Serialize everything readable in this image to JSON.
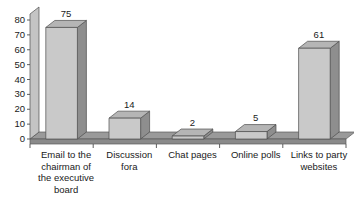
{
  "chart_data": {
    "type": "bar",
    "title": "",
    "subtitle": "",
    "xlabel": "",
    "ylabel": "",
    "ylim": [
      0,
      80
    ],
    "ytick_step": 10,
    "yticks": [
      "0",
      "10",
      "20",
      "30",
      "40",
      "50",
      "60",
      "70",
      "80"
    ],
    "grid": false,
    "legend": false,
    "three_d": true,
    "categories": [
      "Email to the chairman of the executive board",
      "Discussion fora",
      "Chat pages",
      "Online polls",
      "Links to party websites"
    ],
    "category_lines": [
      [
        "Email to the",
        "chairman of",
        "the executive",
        "board"
      ],
      [
        "Discussion",
        "fora"
      ],
      [
        "Chat pages"
      ],
      [
        "Online polls"
      ],
      [
        "Links to party",
        "websites"
      ]
    ],
    "values": [
      75,
      14,
      2,
      5,
      61
    ],
    "value_labels": [
      "75",
      "14",
      "2",
      "5",
      "61"
    ],
    "colors": {
      "bar_front": "#c9c9c9",
      "bar_side": "#8e8e8e",
      "bar_top": "#b5b5b5",
      "floor_top": "#9a9a9a",
      "floor_front": "#8a8a8a",
      "axis": "#4d4d4d",
      "text": "#1a1a1a",
      "background": "#ffffff"
    }
  }
}
